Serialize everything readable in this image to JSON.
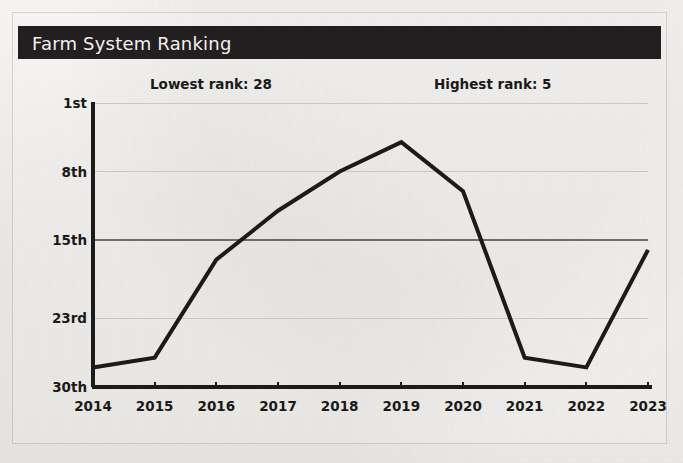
{
  "header": {
    "title": "Farm System Ranking",
    "bar_color": "#231f20",
    "text_color": "#f2f0ee"
  },
  "annotations": [
    {
      "name": "lowest-rank",
      "text": "Lowest rank: 28"
    },
    {
      "name": "highest-rank",
      "text": "Highest rank: 5"
    }
  ],
  "chart_data": {
    "type": "line",
    "title": "Farm System Ranking",
    "xlabel": "",
    "ylabel": "",
    "x": [
      2014,
      2015,
      2016,
      2017,
      2018,
      2019,
      2020,
      2021,
      2022,
      2023
    ],
    "categories": [
      "2014",
      "2015",
      "2016",
      "2017",
      "2018",
      "2019",
      "2020",
      "2021",
      "2022",
      "2023"
    ],
    "values": [
      28,
      27,
      17,
      12,
      8,
      5,
      10,
      27,
      28,
      16
    ],
    "series": [
      {
        "name": "Farm System Ranking",
        "values": [
          28,
          27,
          17,
          12,
          8,
          5,
          10,
          27,
          28,
          16
        ],
        "color": "#1d1b1a",
        "line_width": 4
      }
    ],
    "y_inverted": true,
    "ylim": [
      1,
      30
    ],
    "ytick_values": [
      1,
      8,
      15,
      23,
      30
    ],
    "ytick_labels": [
      "1st",
      "8th",
      "15th",
      "23rd",
      "30th"
    ],
    "xtick_labels": [
      "2014",
      "2015",
      "2016",
      "2017",
      "2018",
      "2019",
      "2020",
      "2021",
      "2022",
      "2023"
    ],
    "grid": true,
    "emphasized_gridline": 15,
    "gridline_color": "#c9c7c4",
    "emphasized_gridline_color": "#6e6c69",
    "axis_color": "#1d1b1a",
    "legend": false,
    "highest_rank": 5,
    "highest_rank_year": 2019,
    "lowest_rank": 28,
    "lowest_rank_years": [
      2014,
      2022
    ]
  },
  "colors": {
    "page_background": "#f3f2f0",
    "line": "#1d1b1a",
    "text": "#1b1918"
  }
}
